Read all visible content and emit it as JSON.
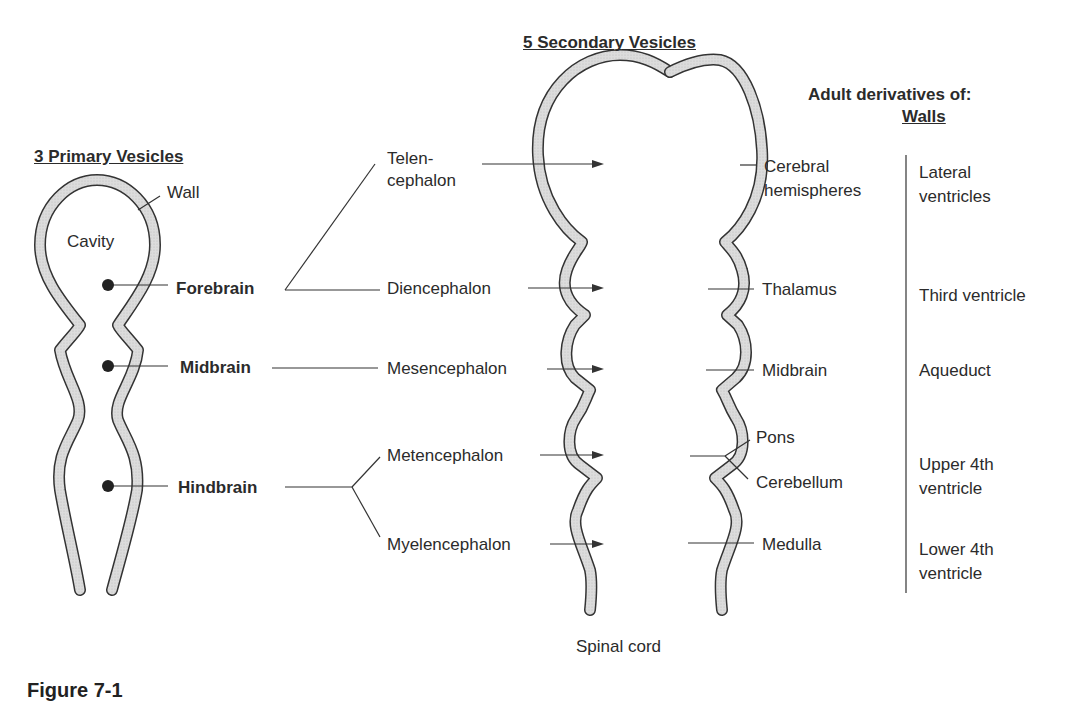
{
  "titles": {
    "primary": "3 Primary Vesicles",
    "secondary": "5 Secondary Vesicles",
    "adult_heading": "Adult derivatives of:",
    "walls_heading": "Walls"
  },
  "primary": {
    "wall": "Wall",
    "cavity": "Cavity",
    "forebrain": "Forebrain",
    "midbrain": "Midbrain",
    "hindbrain": "Hindbrain"
  },
  "secondary": {
    "telen_1": "Telen-",
    "telen_2": "cephalon",
    "diencephalon": "Diencephalon",
    "mesencephalon": "Mesencephalon",
    "metencephalon": "Metencephalon",
    "myelencephalon": "Myelencephalon",
    "spinal_cord": "Spinal cord"
  },
  "walls": {
    "cerebral_1": "Cerebral",
    "cerebral_2": "hemispheres",
    "thalamus": "Thalamus",
    "midbrain": "Midbrain",
    "pons": "Pons",
    "cerebellum": "Cerebellum",
    "medulla": "Medulla"
  },
  "cavities": {
    "lateral_1": "Lateral",
    "lateral_2": "ventricles",
    "third": "Third ventricle",
    "aqueduct": "Aqueduct",
    "upper_1": "Upper 4th",
    "upper_2": "ventricle",
    "lower_1": "Lower 4th",
    "lower_2": "ventricle"
  },
  "caption": "Figure 7-1",
  "colors": {
    "wall_fill": "#d4d4d4",
    "line": "#333333"
  }
}
